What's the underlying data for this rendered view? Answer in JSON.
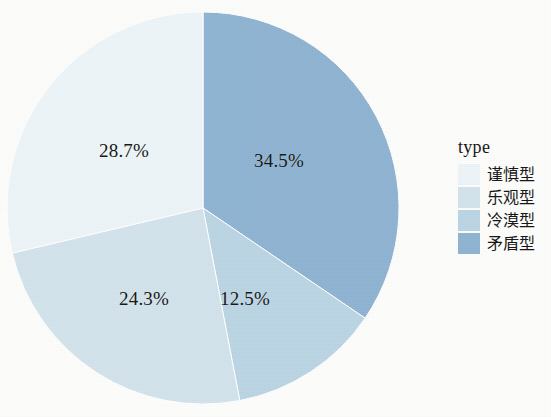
{
  "chart_data": {
    "type": "pie",
    "title": "",
    "legend_title": "type",
    "legend_position": "right",
    "categories": [
      "谨慎型",
      "乐观型",
      "冷漠型",
      "矛盾型"
    ],
    "values": [
      28.7,
      24.3,
      12.5,
      34.5
    ],
    "value_labels": [
      "28.7%",
      "24.3%",
      "12.5%",
      "34.5%"
    ],
    "colors": [
      "#eef5f8",
      "#d3e3ec",
      "#bcd5e4",
      "#8fb4d2"
    ],
    "units": "percent",
    "start_angle_deg": 0,
    "direction": "clockwise",
    "slices": [
      {
        "label": "矛盾型",
        "value": 34.5,
        "value_label": "34.5%",
        "color": "#8fb4d2",
        "start_deg": 0,
        "end_deg": 124.2
      },
      {
        "label": "冷漠型",
        "value": 12.5,
        "value_label": "12.5%",
        "color": "#bcd5e4",
        "start_deg": 124.2,
        "end_deg": 169.2
      },
      {
        "label": "乐观型",
        "value": 24.3,
        "value_label": "24.3%",
        "color": "#d3e3ec",
        "start_deg": 169.2,
        "end_deg": 256.7
      },
      {
        "label": "谨慎型",
        "value": 28.7,
        "value_label": "28.7%",
        "color": "#eef5f8",
        "start_deg": 256.7,
        "end_deg": 360.0
      }
    ]
  },
  "legend": {
    "title": "type",
    "items": [
      {
        "label": "谨慎型",
        "color": "#eef5f8"
      },
      {
        "label": "乐观型",
        "color": "#d3e3ec"
      },
      {
        "label": "冷漠型",
        "color": "#bcd5e4"
      },
      {
        "label": "矛盾型",
        "color": "#8fb4d2"
      }
    ]
  },
  "labels": {
    "top_right": "34.5%",
    "top_left": "28.7%",
    "bottom_left": "24.3%",
    "bottom_right": "12.5%"
  },
  "style": {
    "background": "#fdfdfb",
    "text_color": "#161616"
  }
}
